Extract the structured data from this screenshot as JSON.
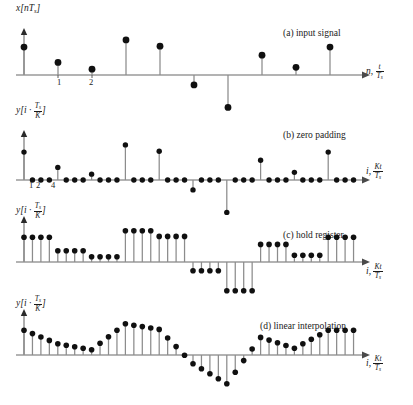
{
  "figure": {
    "marker_color": "#101010",
    "stem_color": "#8c8c8c",
    "axis_color": "#9a9a9a",
    "upsample_factor": 4
  },
  "panels": [
    {
      "id": "a",
      "caption": "(a) input signal",
      "ylabel_plain": "x[nT_s]",
      "ylabel_var": "x",
      "ylabel_inner": "nT",
      "ylabel_sub": "s",
      "xlabel_var": "n,",
      "xlabel_num": "t",
      "xlabel_den": "T",
      "xlabel_den_sub": "s",
      "ticks": [
        {
          "label": "1",
          "index": 1
        },
        {
          "label": "2",
          "index": 2
        }
      ]
    },
    {
      "id": "b",
      "caption": "(b) zero padding",
      "ylabel_plain": "y[i . T_s/K]",
      "ylabel_var": "y",
      "ylabel_inner": "i ·",
      "ylabel_num": "T",
      "ylabel_num_sub": "s",
      "ylabel_den": "K",
      "xlabel_var": "i,",
      "xlabel_num": "Kt",
      "xlabel_den": "T",
      "xlabel_den_sub": "s",
      "ticks": [
        {
          "label": "1",
          "index": 1
        },
        {
          "label": "2",
          "index": 2
        },
        {
          "label": "4",
          "index": 4
        }
      ]
    },
    {
      "id": "c",
      "caption": "(c) hold register",
      "ylabel_plain": "y[i . T_s/K]",
      "ylabel_var": "y",
      "ylabel_inner": "i ·",
      "ylabel_num": "T",
      "ylabel_num_sub": "s",
      "ylabel_den": "K",
      "xlabel_var": "i,",
      "xlabel_num": "Kt",
      "xlabel_den": "T",
      "xlabel_den_sub": "s",
      "ticks": []
    },
    {
      "id": "d",
      "caption": "(d) linear interpolation",
      "ylabel_plain": "y[i . T_s/K]",
      "ylabel_var": "y",
      "ylabel_inner": "i ·",
      "ylabel_num": "T",
      "ylabel_num_sub": "s",
      "ylabel_den": "K",
      "xlabel_var": "i,",
      "xlabel_num": "Kt",
      "xlabel_den": "T",
      "xlabel_den_sub": "s",
      "ticks": []
    }
  ],
  "chart_data": [
    {
      "type": "scatter",
      "panel": "a",
      "title": "(a) input signal",
      "xlabel": "n, t/Ts",
      "ylabel": "x[nTs]",
      "grid": false,
      "legend": "none",
      "ylim": [
        -1.05,
        1.05
      ],
      "xlim": [
        -0.4,
        10.2
      ],
      "x": [
        0,
        1,
        2,
        3,
        4,
        5,
        6,
        7,
        8,
        9
      ],
      "values": [
        0.62,
        0.28,
        0.13,
        0.78,
        0.64,
        -0.22,
        -0.72,
        0.44,
        0.17,
        0.62
      ]
    },
    {
      "type": "scatter",
      "panel": "b",
      "title": "(b) zero padding",
      "xlabel": "i, Kt/Ts",
      "ylabel": "y[i . Ts/K]",
      "grid": false,
      "legend": "none",
      "ylim": [
        -1.05,
        1.05
      ],
      "xlim": [
        -0.4,
        40.5
      ],
      "x": [
        0,
        1,
        2,
        3,
        4,
        5,
        6,
        7,
        8,
        9,
        10,
        11,
        12,
        13,
        14,
        15,
        16,
        17,
        18,
        19,
        20,
        21,
        22,
        23,
        24,
        25,
        26,
        27,
        28,
        29,
        30,
        31,
        32,
        33,
        34,
        35,
        36,
        37,
        38,
        39
      ],
      "values": [
        0.62,
        0,
        0,
        0,
        0.28,
        0,
        0,
        0,
        0.13,
        0,
        0,
        0,
        0.78,
        0,
        0,
        0,
        0.64,
        0,
        0,
        0,
        -0.22,
        0,
        0,
        0,
        -0.72,
        0,
        0,
        0,
        0.44,
        0,
        0,
        0,
        0.17,
        0,
        0,
        0,
        0.62,
        0,
        0,
        0
      ]
    },
    {
      "type": "scatter",
      "panel": "c",
      "title": "(c) hold register",
      "xlabel": "i, Kt/Ts",
      "ylabel": "y[i . Ts/K]",
      "grid": false,
      "legend": "none",
      "ylim": [
        -1.05,
        1.05
      ],
      "xlim": [
        -0.4,
        40.5
      ],
      "x": [
        0,
        1,
        2,
        3,
        4,
        5,
        6,
        7,
        8,
        9,
        10,
        11,
        12,
        13,
        14,
        15,
        16,
        17,
        18,
        19,
        20,
        21,
        22,
        23,
        24,
        25,
        26,
        27,
        28,
        29,
        30,
        31,
        32,
        33,
        34,
        35,
        36,
        37,
        38,
        39
      ],
      "values": [
        0.62,
        0.62,
        0.62,
        0.62,
        0.28,
        0.28,
        0.28,
        0.28,
        0.13,
        0.13,
        0.13,
        0.13,
        0.78,
        0.78,
        0.78,
        0.78,
        0.64,
        0.64,
        0.64,
        0.64,
        -0.22,
        -0.22,
        -0.22,
        -0.22,
        -0.72,
        -0.72,
        -0.72,
        -0.72,
        0.44,
        0.44,
        0.44,
        0.44,
        0.17,
        0.17,
        0.17,
        0.17,
        0.62,
        0.62,
        0.62,
        0.62
      ]
    },
    {
      "type": "scatter",
      "panel": "d",
      "title": "(d) linear interpolation",
      "xlabel": "i, Kt/Ts",
      "ylabel": "y[i . Ts/K]",
      "grid": false,
      "legend": "none",
      "ylim": [
        -1.05,
        1.05
      ],
      "xlim": [
        -0.4,
        40.5
      ],
      "x": [
        0,
        1,
        2,
        3,
        4,
        5,
        6,
        7,
        8,
        9,
        10,
        11,
        12,
        13,
        14,
        15,
        16,
        17,
        18,
        19,
        20,
        21,
        22,
        23,
        24,
        25,
        26,
        27,
        28,
        29,
        30,
        31,
        32,
        33,
        34,
        35,
        36,
        37,
        38,
        39
      ],
      "values": [
        0.62,
        0.535,
        0.45,
        0.365,
        0.28,
        0.2425,
        0.205,
        0.1675,
        0.13,
        0.2925,
        0.455,
        0.6175,
        0.78,
        0.745,
        0.71,
        0.675,
        0.64,
        0.425,
        0.21,
        -0.005,
        -0.22,
        -0.345,
        -0.47,
        -0.595,
        -0.72,
        -0.43,
        -0.14,
        0.15,
        0.44,
        0.3725,
        0.305,
        0.2375,
        0.17,
        0.2825,
        0.395,
        0.5075,
        0.62,
        0.62,
        0.62,
        0.62
      ]
    }
  ]
}
